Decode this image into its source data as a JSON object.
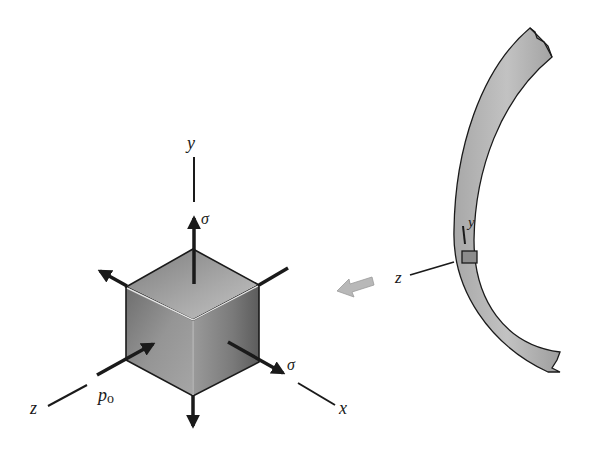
{
  "figure": {
    "cube_element": {
      "axis_labels": {
        "y": "y",
        "x": "x",
        "z": "z"
      },
      "stress_labels": {
        "sigma_top": "σ",
        "sigma_right": "σ",
        "pressure": "p",
        "pressure_subscript": "o"
      }
    },
    "wall_section": {
      "axis_labels": {
        "y": "y",
        "z": "z"
      }
    },
    "colors": {
      "line": "#1a1a1a",
      "cube_top": "#9a9a9a",
      "cube_left": "#8a8a8a",
      "cube_right": "#7a7a7a",
      "wall_fill": "#b4b4b4",
      "block_arrow": "#b8b8b8"
    }
  }
}
